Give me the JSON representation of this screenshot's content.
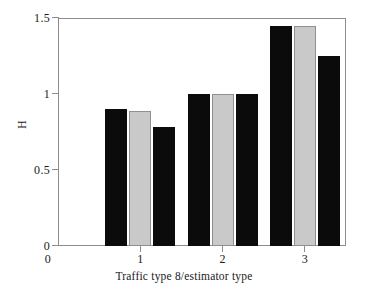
{
  "chart_data": {
    "type": "bar",
    "title": "",
    "xlabel": "Traffic type 8/estimator type",
    "ylabel": "H",
    "categories": [
      "1",
      "2",
      "3"
    ],
    "series": [
      {
        "name": "estimator 1",
        "color": "#0b0b0b",
        "values": [
          0.9,
          1.0,
          1.45
        ]
      },
      {
        "name": "estimator 2",
        "color": "#c9c9c9",
        "values": [
          0.89,
          1.0,
          1.45
        ]
      },
      {
        "name": "estimator 3",
        "color": "#0b0b0b",
        "values": [
          0.78,
          1.0,
          1.25
        ]
      }
    ],
    "ylim": [
      0,
      1.5
    ],
    "xlim": [
      0,
      3.5
    ],
    "ytick_labels": [
      "0",
      "0.5",
      "1",
      "1.5"
    ],
    "ytick_values": [
      0,
      0.5,
      1,
      1.5
    ],
    "xtick_labels": [
      "0",
      "1",
      "2",
      "3"
    ],
    "xtick_values": [
      0,
      1,
      2,
      3
    ],
    "grid": false,
    "legend": "none",
    "frame": true
  },
  "axes": {
    "y_label_text": "H",
    "x_label_text": "Traffic type 8/estimator type",
    "ytick_0": "0",
    "ytick_1": "0.5",
    "ytick_2": "1",
    "ytick_3": "1.5",
    "xtick_0": "0",
    "xtick_1": "1",
    "xtick_2": "2",
    "xtick_3": "3"
  },
  "colors": {
    "bar_dark": "#0b0b0b",
    "bar_light": "#c9c9c9",
    "axis": "#8c8c8c",
    "background": "#ffffff",
    "text": "#1a1a1a"
  }
}
